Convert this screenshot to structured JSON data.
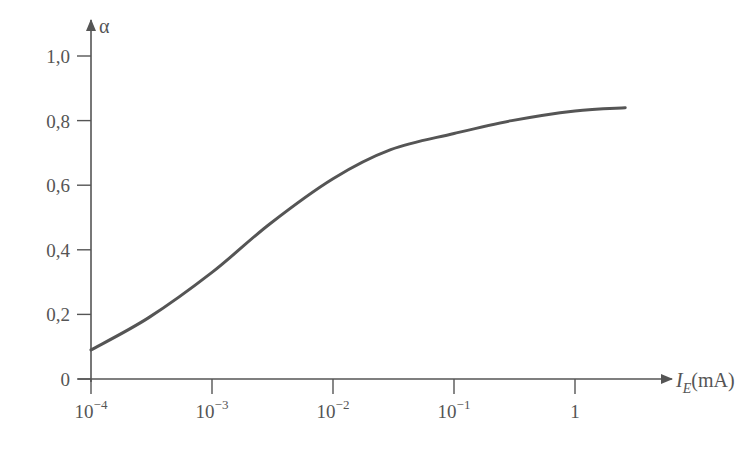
{
  "chart_data": {
    "type": "line",
    "title": "",
    "xlabel": "I_E (mA)",
    "xlabel_main": "I",
    "xlabel_sub": "E",
    "xlabel_unit": "(mA)",
    "ylabel": "α",
    "xscale": "log",
    "xlim": [
      0.0001,
      2.5
    ],
    "ylim": [
      0,
      1.05
    ],
    "grid": false,
    "legend": null,
    "x_ticks": [
      {
        "value": 0.0001,
        "base": "10",
        "exp": "−4"
      },
      {
        "value": 0.001,
        "base": "10",
        "exp": "−3"
      },
      {
        "value": 0.01,
        "base": "10",
        "exp": "−2"
      },
      {
        "value": 0.1,
        "base": "10",
        "exp": "−1"
      },
      {
        "value": 1,
        "base": "1",
        "exp": ""
      }
    ],
    "y_ticks": [
      {
        "value": 0,
        "label": "0"
      },
      {
        "value": 0.2,
        "label": "0,2"
      },
      {
        "value": 0.4,
        "label": "0,4"
      },
      {
        "value": 0.6,
        "label": "0,6"
      },
      {
        "value": 0.8,
        "label": "0,8"
      },
      {
        "value": 1.0,
        "label": "1,0"
      }
    ],
    "series": [
      {
        "name": "alpha",
        "x": [
          0.0001,
          0.0003,
          0.001,
          0.003,
          0.01,
          0.03,
          0.1,
          0.3,
          1,
          2.6
        ],
        "values": [
          0.09,
          0.19,
          0.33,
          0.48,
          0.62,
          0.71,
          0.76,
          0.8,
          0.83,
          0.84
        ]
      }
    ]
  }
}
